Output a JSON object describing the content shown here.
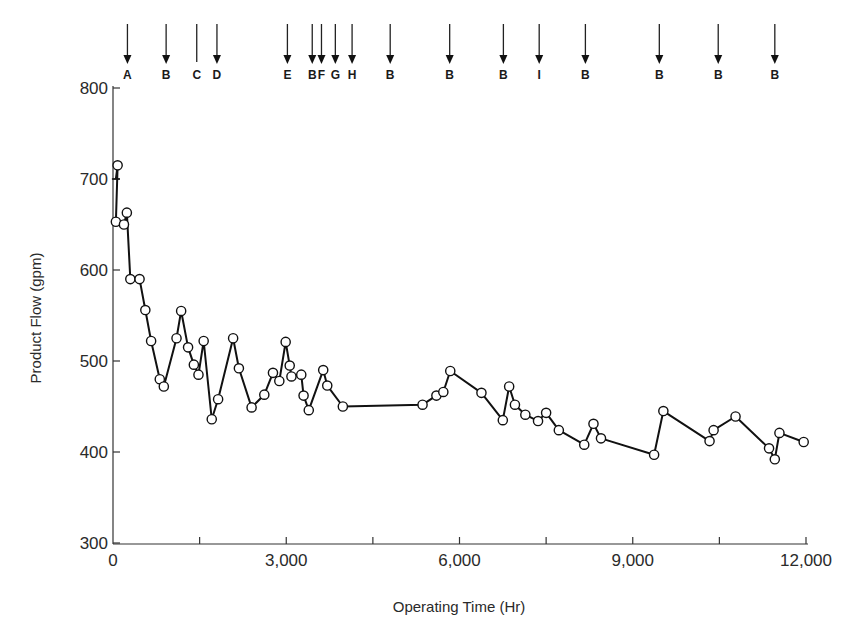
{
  "chart_data": {
    "type": "line",
    "title": "",
    "xlabel": "Operating Time (Hr)",
    "ylabel": "Product Flow (gpm)",
    "xlim": [
      0,
      12000
    ],
    "ylim": [
      300,
      800
    ],
    "x_ticks": [
      0,
      3000,
      6000,
      9000,
      12000
    ],
    "x_tick_labels": [
      "0",
      "3,000",
      "6,000",
      "9,000",
      "12,000"
    ],
    "x_minor_ticks": [
      1500,
      4500,
      7500,
      10500
    ],
    "y_ticks": [
      300,
      400,
      500,
      600,
      700,
      800
    ],
    "y_tick_labels": [
      "300",
      "400",
      "500",
      "600",
      "700",
      "800"
    ],
    "grid": false,
    "legend": null,
    "marker": "open-circle",
    "series": [
      {
        "name": "Product Flow",
        "points": [
          [
            50,
            700
          ],
          [
            80,
            715
          ],
          [
            50,
            653
          ],
          [
            190,
            650
          ],
          [
            240,
            663
          ],
          [
            300,
            590
          ],
          [
            460,
            590
          ],
          [
            560,
            556
          ],
          [
            660,
            522
          ],
          [
            810,
            480
          ],
          [
            880,
            472
          ],
          [
            1100,
            525
          ],
          [
            1180,
            555
          ],
          [
            1300,
            515
          ],
          [
            1400,
            496
          ],
          [
            1480,
            485
          ],
          [
            1570,
            522
          ],
          [
            1710,
            436
          ],
          [
            1820,
            458
          ],
          [
            2080,
            525
          ],
          [
            2180,
            492
          ],
          [
            2400,
            449
          ],
          [
            2620,
            463
          ],
          [
            2770,
            487
          ],
          [
            2880,
            478
          ],
          [
            2990,
            521
          ],
          [
            3060,
            495
          ],
          [
            3090,
            483
          ],
          [
            3260,
            485
          ],
          [
            3300,
            462
          ],
          [
            3390,
            446
          ],
          [
            3640,
            490
          ],
          [
            3710,
            473
          ],
          [
            3980,
            450
          ],
          [
            5360,
            452
          ],
          [
            5600,
            462
          ],
          [
            5720,
            466
          ],
          [
            5840,
            489
          ],
          [
            6380,
            465
          ],
          [
            6750,
            435
          ],
          [
            6860,
            472
          ],
          [
            6960,
            452
          ],
          [
            7140,
            441
          ],
          [
            7360,
            434
          ],
          [
            7500,
            443
          ],
          [
            7720,
            424
          ],
          [
            8160,
            408
          ],
          [
            8320,
            431
          ],
          [
            8450,
            415
          ],
          [
            9370,
            397
          ],
          [
            9530,
            445
          ],
          [
            10330,
            412
          ],
          [
            10400,
            424
          ],
          [
            10780,
            439
          ],
          [
            11360,
            404
          ],
          [
            11460,
            392
          ],
          [
            11540,
            421
          ],
          [
            11960,
            411
          ]
        ]
      }
    ],
    "event_markers": [
      {
        "label": "A",
        "x": 250
      },
      {
        "label": "B",
        "x": 920
      },
      {
        "label": "C",
        "x": 1450
      },
      {
        "label": "D",
        "x": 1800
      },
      {
        "label": "E",
        "x": 3020
      },
      {
        "label": "B",
        "x": 3450
      },
      {
        "label": "F",
        "x": 3610
      },
      {
        "label": "G",
        "x": 3850
      },
      {
        "label": "H",
        "x": 4140
      },
      {
        "label": "B",
        "x": 4800
      },
      {
        "label": "B",
        "x": 5830
      },
      {
        "label": "B",
        "x": 6760
      },
      {
        "label": "I",
        "x": 7380
      },
      {
        "label": "B",
        "x": 8180
      },
      {
        "label": "B",
        "x": 9460
      },
      {
        "label": "B",
        "x": 10480
      },
      {
        "label": "B",
        "x": 11460
      }
    ]
  }
}
